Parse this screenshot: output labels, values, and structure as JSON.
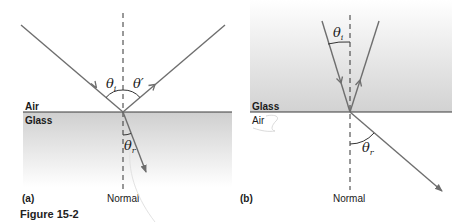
{
  "figure": {
    "caption": "Figure 15-2",
    "panels": [
      {
        "id": "a",
        "label": "(a)",
        "upper_medium": "Air",
        "lower_medium": "Glass",
        "normal_label": "Normal",
        "angles": {
          "incident": {
            "symbol": "θ",
            "subscript": "i"
          },
          "reflected": {
            "symbol": "θ′",
            "subscript": ""
          },
          "refracted": {
            "symbol": "θ",
            "subscript": "r"
          }
        }
      },
      {
        "id": "b",
        "label": "(b)",
        "upper_medium": "Glass",
        "lower_medium": "Air",
        "normal_label": "Normal",
        "angles": {
          "incident": {
            "symbol": "θ",
            "subscript": "i"
          },
          "refracted": {
            "symbol": "θ",
            "subscript": "r"
          }
        }
      }
    ]
  },
  "colors": {
    "ray": "#6e6e6e",
    "interface": "#3a3a3a",
    "glass": "#d4d4d4",
    "text": "#1a1a1a"
  }
}
